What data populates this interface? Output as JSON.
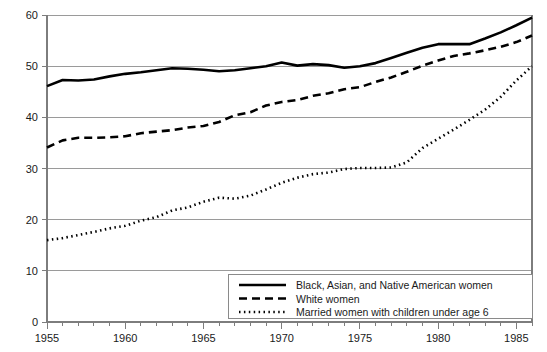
{
  "chart_data": {
    "type": "line",
    "title": "",
    "xlabel": "",
    "ylabel": "",
    "xlim": [
      1955,
      1986
    ],
    "ylim": [
      0,
      60
    ],
    "grid": true,
    "legend_position": "bottom-right",
    "x_tick_labels": [
      "1955",
      "1960",
      "1965",
      "1970",
      "1975",
      "1980",
      "1985"
    ],
    "x_tick_values": [
      1955,
      1960,
      1965,
      1970,
      1975,
      1980,
      1985
    ],
    "x_minor_tick_step": 1,
    "y_tick_labels": [
      "0",
      "10",
      "20",
      "30",
      "40",
      "50",
      "60"
    ],
    "y_tick_values": [
      0,
      10,
      20,
      30,
      40,
      50,
      60
    ],
    "x": [
      1955,
      1956,
      1957,
      1958,
      1959,
      1960,
      1961,
      1962,
      1963,
      1964,
      1965,
      1966,
      1967,
      1968,
      1969,
      1970,
      1971,
      1972,
      1973,
      1974,
      1975,
      1976,
      1977,
      1978,
      1979,
      1980,
      1981,
      1982,
      1983,
      1984,
      1985,
      1986
    ],
    "series": [
      {
        "name": "Black, Asian, and Native American women",
        "style": "solid",
        "color": "#000000",
        "values": [
          46.1,
          47.3,
          47.2,
          47.4,
          48.0,
          48.5,
          48.8,
          49.2,
          49.6,
          49.5,
          49.3,
          49.0,
          49.2,
          49.6,
          50.0,
          50.7,
          50.1,
          50.4,
          50.2,
          49.7,
          50.0,
          50.6,
          51.6,
          52.6,
          53.6,
          54.3,
          54.3,
          54.3,
          55.4,
          56.6,
          58.0,
          59.5
        ]
      },
      {
        "name": "White women",
        "style": "dashed",
        "color": "#000000",
        "values": [
          34.1,
          35.5,
          36.0,
          36.0,
          36.1,
          36.3,
          36.9,
          37.2,
          37.5,
          38.0,
          38.3,
          39.1,
          40.4,
          41.0,
          42.3,
          43.0,
          43.4,
          44.2,
          44.7,
          45.5,
          45.9,
          46.9,
          47.8,
          48.9,
          50.1,
          51.1,
          52.0,
          52.5,
          53.1,
          53.8,
          54.7,
          56.0
        ]
      },
      {
        "name": "Married women with children under age 6",
        "style": "dotted",
        "color": "#000000",
        "values": [
          16.0,
          16.4,
          17.0,
          17.6,
          18.3,
          18.8,
          19.8,
          20.5,
          21.8,
          22.4,
          23.5,
          24.3,
          24.1,
          24.7,
          25.9,
          27.2,
          28.2,
          28.9,
          29.2,
          29.9,
          30.1,
          30.1,
          30.2,
          31.2,
          34.0,
          35.8,
          37.6,
          39.5,
          41.5,
          44.0,
          47.2,
          50.0
        ]
      }
    ]
  },
  "legend": {
    "items": [
      {
        "label": "Black, Asian, and Native American women",
        "style": "solid"
      },
      {
        "label": "White women",
        "style": "dashed"
      },
      {
        "label": "Married women with children under age 6",
        "style": "dotted"
      }
    ]
  }
}
